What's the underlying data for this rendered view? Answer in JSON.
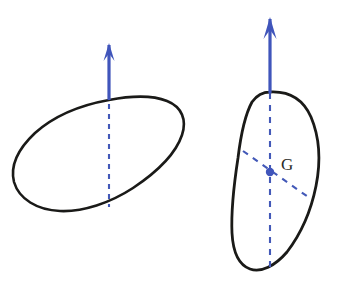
{
  "figure": {
    "background_color": "#ffffff",
    "outline_color": "#1a1a18",
    "accent_color": "#4055bb",
    "label_color": "#2a2a26",
    "panels": [
      {
        "id": "left-panel",
        "name": "tilted-blob-without-centroid",
        "shape": {
          "name": "tilted-oval-blob",
          "outline_stroke_width": 2.6,
          "path": "M 109 100 C 130 96 152 95 167 101 C 182 107 187 120 182 135 C 176 153 157 172 133 188 C 110 203 83 212 60 211 C 37 210 19 199 14 182 C 10 166 18 149 35 133 C 54 116 81 105 109 100 Z"
        },
        "force_arrow": {
          "name": "applied-force-arrow",
          "label": "",
          "direction": "up",
          "shaft": {
            "x": 109,
            "y1": 45,
            "y2": 100
          },
          "head": {
            "tip_x": 109,
            "tip_y": 43,
            "half_width": 5.5,
            "length": 18
          }
        },
        "dashed_axes": [
          {
            "name": "vertical-line-of-action",
            "x1": 109,
            "y1": 104,
            "x2": 109,
            "y2": 207,
            "dash": "5 5"
          }
        ],
        "centroid": null
      },
      {
        "id": "right-panel",
        "name": "upright-blob-with-centroid",
        "shape": {
          "name": "upright-oval-blob",
          "outline_stroke_width": 2.8,
          "path": "M 270 92 C 289 91 303 99 311 117 C 319 136 321 161 316 186 C 311 211 300 235 287 252 C 275 266 261 273 250 269 C 239 265 233 252 232 233 C 231 211 234 184 238 158 C 241 133 246 113 252 102 C 257 95 263 92 270 92 Z"
        },
        "force_arrow": {
          "name": "applied-force-arrow",
          "label": "",
          "direction": "up",
          "shaft": {
            "x": 270,
            "y1": 19,
            "y2": 93
          },
          "head": {
            "tip_x": 270,
            "tip_y": 17,
            "half_width": 6.5,
            "length": 22
          }
        },
        "dashed_axes": [
          {
            "name": "vertical-centroidal-axis",
            "x1": 270,
            "y1": 93,
            "x2": 270,
            "y2": 272,
            "dash": "6 6"
          },
          {
            "name": "oblique-centroidal-axis",
            "x1": 243,
            "y1": 151,
            "x2": 311,
            "y2": 199,
            "dash": "6 6"
          }
        ],
        "centroid": {
          "name": "centroid-point",
          "label": "G",
          "x": 270,
          "y": 172,
          "dot_radius": 4.2,
          "label_x": 281,
          "label_y": 170
        }
      }
    ]
  }
}
